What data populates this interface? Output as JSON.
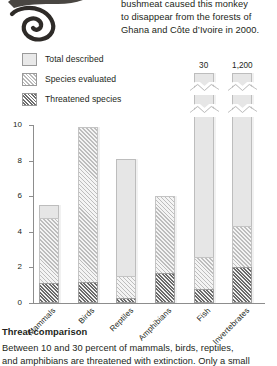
{
  "top_caption": {
    "lines": [
      "bushmeat caused this monkey",
      "to disappear from the forests of",
      "Ghana and Côte d’Ivoire in 2000."
    ]
  },
  "photo": {
    "alt": "monkey-photograph"
  },
  "legend": {
    "items": [
      {
        "label": "Total described",
        "swatch": "plain-light-box",
        "color": "#e9e9e9"
      },
      {
        "label": "Species evaluated",
        "swatch": "light-diagonal-hatch",
        "color": "#b9b9b9"
      },
      {
        "label": "Threatened species",
        "swatch": "dense-diagonal-hatch",
        "color": "#6e6e6e"
      }
    ]
  },
  "bottom_caption": {
    "title": "Threat comparison",
    "lines": [
      "Between 10 and 30 percent of mammals, birds, reptiles,",
      "and amphibians are threatened with extinction. Only a small"
    ]
  },
  "chart_data": {
    "type": "bar",
    "title": "Threat comparison",
    "xlabel": "",
    "ylabel": "Thousands of species",
    "ylim": [
      0,
      10
    ],
    "yticks": [
      0,
      2,
      4,
      6,
      8,
      10
    ],
    "grid": false,
    "legend_position": "top-left",
    "categories": [
      "Mammals",
      "Birds",
      "Reptiles",
      "Amphibians",
      "Fish",
      "Invertebrates"
    ],
    "series": [
      {
        "name": "Total described",
        "values": [
          5.5,
          9.9,
          8.1,
          6.0,
          30,
          1200
        ]
      },
      {
        "name": "Species evaluated",
        "values": [
          4.8,
          9.9,
          1.5,
          6.0,
          2.6,
          4.3
        ]
      },
      {
        "name": "Threatened species",
        "values": [
          1.1,
          1.2,
          0.3,
          1.7,
          0.8,
          2.0
        ]
      }
    ],
    "value_labels": [
      {
        "category": "Fish",
        "label": "30"
      },
      {
        "category": "Invertebrates",
        "label": "1,200"
      }
    ],
    "axis_breaks": [
      "Fish",
      "Invertebrates"
    ]
  }
}
